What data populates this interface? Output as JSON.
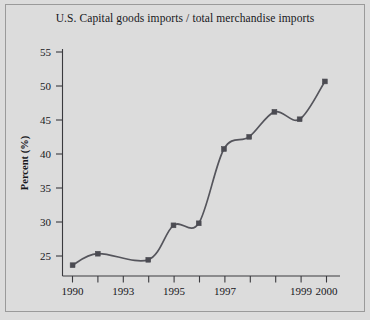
{
  "figure": {
    "background_color": "#dcdcdc",
    "border_color": "#9a9a9a",
    "title": "U.S. Capital goods imports / total merchandise imports"
  },
  "chart_data": {
    "type": "line",
    "title": "U.S. Capital goods imports / total merchandise imports",
    "xlabel": "",
    "ylabel": "Percent (%)",
    "x": [
      1990,
      1991,
      1993,
      1994,
      1995,
      1996,
      1997,
      1998,
      1999,
      2000
    ],
    "values": [
      24.4,
      26.1,
      25.2,
      30.3,
      30.6,
      41.6,
      43.4,
      47.1,
      46.0,
      51.6
    ],
    "series": [
      {
        "name": "Capital goods imports share",
        "values": [
          24.4,
          26.1,
          25.2,
          30.3,
          30.6,
          41.6,
          43.4,
          47.1,
          46.0,
          51.6
        ]
      }
    ],
    "xlim": [
      1989.6,
      2000.6
    ],
    "ylim": [
      22.8,
      56.4
    ],
    "xticks": [
      1990,
      1991,
      1992,
      1993,
      1994,
      1995,
      1996,
      1997,
      1998,
      1999,
      2000
    ],
    "xtick_labels": [
      {
        "value": 1990,
        "label": "1990"
      },
      {
        "value": 1993,
        "label": "1993"
      },
      {
        "value": 1995,
        "label": "1995"
      },
      {
        "value": 1997,
        "label": "1997"
      },
      {
        "value": 1999,
        "label": "1999"
      },
      {
        "value": 2000,
        "label": "2000"
      }
    ],
    "yticks": [
      25,
      30,
      35,
      40,
      45,
      50,
      55
    ],
    "ytick_labels": [
      "25",
      "30",
      "35",
      "40",
      "45",
      "50",
      "55"
    ],
    "grid": false,
    "legend": false,
    "line_color": "#55555c",
    "marker_color": "#4b4b52",
    "marker_shape": "square",
    "smoothing": "spline"
  },
  "axes": {
    "y_title": "Percent (%)",
    "y_labels": [
      "55",
      "50",
      "45",
      "40",
      "35",
      "30",
      "25"
    ],
    "x_labels": [
      "1990",
      "1993",
      "1995",
      "1997",
      "1999",
      "2000"
    ]
  }
}
